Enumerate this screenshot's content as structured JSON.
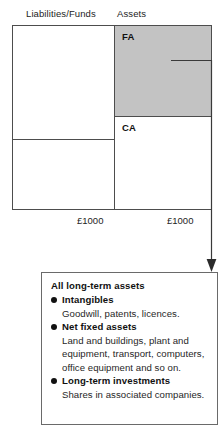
{
  "diagram": {
    "headers": {
      "liabilities": "Liabilities/Funds",
      "assets": "Assets"
    },
    "assets_column": {
      "fixed_assets_label": "FA",
      "current_assets_label": "CA"
    },
    "totals": {
      "liabilities_total": "£1000",
      "assets_total": "£1000"
    },
    "colors": {
      "fixed_assets_fill": "#c3c3c3",
      "box_border": "#4d4d4d",
      "callout_border": "#6a6a6a",
      "connector": "#3a3a3a"
    }
  },
  "callout": {
    "title": "All long-term assets",
    "items": [
      {
        "heading": "Intangibles",
        "description": "Goodwill, patents, licences."
      },
      {
        "heading": "Net fixed assets",
        "description": "Land and buildings, plant and equipment, transport, computers, office equipment and so on."
      },
      {
        "heading": "Long-term investments",
        "description": "Shares in associated companies."
      }
    ]
  }
}
